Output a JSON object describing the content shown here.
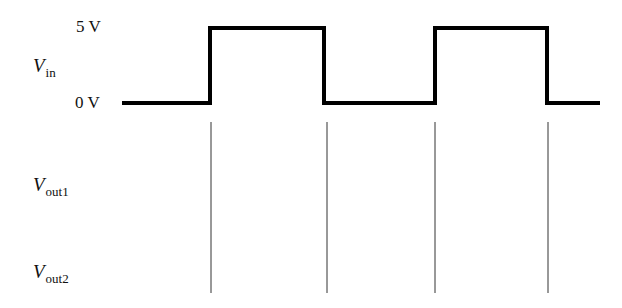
{
  "signals": [
    {
      "id": "vin",
      "symbol": "V",
      "subscript": "in"
    },
    {
      "id": "vout1",
      "symbol": "V",
      "subscript": "out1"
    },
    {
      "id": "vout2",
      "symbol": "V",
      "subscript": "out2"
    }
  ],
  "levels": {
    "high": "5 V",
    "low": "0 V"
  },
  "waveform": {
    "type": "square",
    "start_x": 122,
    "end_x": 600,
    "low_y": 103,
    "high_y": 28,
    "edges_x": [
      210,
      324,
      435,
      547
    ],
    "stroke": "#000000",
    "stroke_width": 4
  },
  "guide_lines": {
    "x": [
      211,
      327,
      435,
      548
    ],
    "y_top": 122,
    "y_bottom": 293,
    "stroke": "#333333",
    "stroke_width": 1
  }
}
